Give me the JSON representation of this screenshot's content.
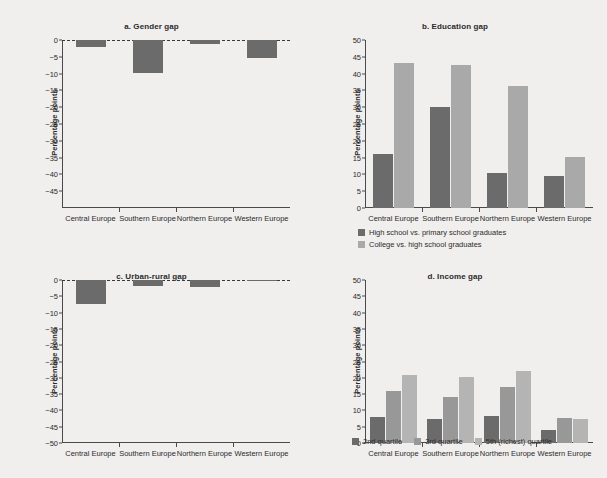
{
  "figure": {
    "background_color": "#f0efee",
    "categories": [
      "Central Europe",
      "Southern Europe",
      "Northern Europe",
      "Western Europe"
    ],
    "ylabel": "Percentage points",
    "colors": {
      "dark": "#6b6b6b",
      "mid": "#989898",
      "light": "#a9a9a9"
    }
  },
  "chart_data": [
    {
      "type": "bar",
      "panel": "a",
      "title": "a. Gender gap",
      "categories": [
        "Central Europe",
        "Southern Europe",
        "Northern Europe",
        "Western Europe"
      ],
      "series": [
        {
          "name": "Gender gap",
          "color": "#6b6b6b",
          "values": [
            -2.0,
            -9.7,
            -1.2,
            -5.5
          ]
        }
      ],
      "xlabel": "",
      "ylabel": "Percentage points",
      "ylim": [
        -50,
        0
      ],
      "yticks": [
        0,
        -5,
        -10,
        -15,
        -20,
        -25,
        -30,
        -35,
        -40,
        -45
      ],
      "ytick_labels": [
        "0",
        "−5",
        "−10",
        "−15",
        "−20",
        "−25",
        "−30",
        "−35",
        "−40",
        "−45"
      ],
      "zero_reference_line": true,
      "grid": false,
      "legend": null
    },
    {
      "type": "bar",
      "panel": "b",
      "title": "b. Education gap",
      "categories": [
        "Central Europe",
        "Southern Europe",
        "Northern Europe",
        "Western Europe"
      ],
      "series": [
        {
          "name": "High school vs. primary school graduates",
          "color": "#6b6b6b",
          "values": [
            16.0,
            30.0,
            10.5,
            9.6
          ]
        },
        {
          "name": "College vs. high school graduates",
          "color": "#a9a9a9",
          "values": [
            43.3,
            42.5,
            36.3,
            15.2
          ]
        }
      ],
      "xlabel": "",
      "ylabel": "Percentage points",
      "ylim": [
        0,
        50
      ],
      "yticks": [
        50,
        45,
        40,
        35,
        30,
        25,
        20,
        15,
        10,
        5,
        0
      ],
      "ytick_labels": [
        "50",
        "45",
        "40",
        "35",
        "30",
        "25",
        "20",
        "15",
        "10",
        "5",
        "0"
      ],
      "zero_reference_line": false,
      "grid": false,
      "legend": {
        "position": "bottom-left",
        "layout": "vertical"
      }
    },
    {
      "type": "bar",
      "panel": "c",
      "title": "c. Urban-rural gap",
      "categories": [
        "Central Europe",
        "Southern Europe",
        "Northern Europe",
        "Western Europe"
      ],
      "series": [
        {
          "name": "Urban-rural gap",
          "color": "#6b6b6b",
          "values": [
            -7.5,
            -1.8,
            -2.3,
            -0.3
          ]
        }
      ],
      "xlabel": "",
      "ylabel": "Percentage points",
      "ylim": [
        -50,
        0
      ],
      "yticks": [
        0,
        -5,
        -10,
        -15,
        -20,
        -25,
        -30,
        -35,
        -40,
        -45,
        -50
      ],
      "ytick_labels": [
        "0",
        "−5",
        "−10",
        "−15",
        "−20",
        "−25",
        "−30",
        "−35",
        "−40",
        "−45",
        "−50"
      ],
      "zero_reference_line": true,
      "grid": false,
      "legend": null
    },
    {
      "type": "bar",
      "panel": "d",
      "title": "d. Income gap",
      "categories": [
        "Central Europe",
        "Southern Europe",
        "Northern Europe",
        "Western Europe"
      ],
      "series": [
        {
          "name": "2nd quartile",
          "color": "#6b6b6b",
          "values": [
            8.0,
            7.4,
            8.3,
            4.0
          ]
        },
        {
          "name": "3rd quartile",
          "color": "#989898",
          "values": [
            16.0,
            14.0,
            17.3,
            7.7
          ]
        },
        {
          "name": "5th (richest) quartile",
          "color": "#b4b4b4",
          "values": [
            21.0,
            20.2,
            22.0,
            7.5
          ]
        }
      ],
      "xlabel": "",
      "ylabel": "Percentage points",
      "ylim": [
        0,
        50
      ],
      "yticks": [
        50,
        45,
        40,
        35,
        30,
        25,
        20,
        15,
        10,
        5,
        0
      ],
      "ytick_labels": [
        "50",
        "45",
        "40",
        "35",
        "30",
        "25",
        "20",
        "15",
        "10",
        "5",
        "0"
      ],
      "zero_reference_line": false,
      "grid": false,
      "legend": {
        "position": "bottom-center",
        "layout": "horizontal"
      }
    }
  ]
}
